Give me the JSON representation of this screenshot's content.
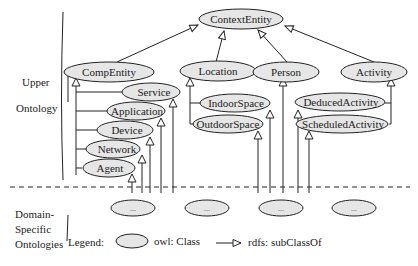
{
  "diagram": {
    "sections": {
      "upper": [
        "Upper",
        "Ontology"
      ],
      "domain": [
        "Domain-",
        "Specific",
        "Ontologies"
      ]
    },
    "nodes": {
      "context_entity": "ContextEntity",
      "comp_entity": "CompEntity",
      "location": "Location",
      "person": "Person",
      "activity": "Activity",
      "service": "Service",
      "application": "Application",
      "device": "Device",
      "network": "Network",
      "agent": "Agent",
      "indoor_space": "IndoorSpace",
      "outdoor_space": "OutdoorSpace",
      "deduced_activity": "DeducedActivity",
      "scheduled_activity": "ScheduledActivity"
    },
    "domain_nodes": [
      "...",
      "...",
      "...",
      "...",
      "..."
    ],
    "edges": [
      {
        "from": "CompEntity",
        "to": "ContextEntity"
      },
      {
        "from": "Location",
        "to": "ContextEntity"
      },
      {
        "from": "Person",
        "to": "ContextEntity"
      },
      {
        "from": "Activity",
        "to": "ContextEntity"
      },
      {
        "from": "Service",
        "to": "CompEntity"
      },
      {
        "from": "Application",
        "to": "CompEntity"
      },
      {
        "from": "Device",
        "to": "CompEntity"
      },
      {
        "from": "Network",
        "to": "CompEntity"
      },
      {
        "from": "Agent",
        "to": "CompEntity"
      },
      {
        "from": "IndoorSpace",
        "to": "Location"
      },
      {
        "from": "OutdoorSpace",
        "to": "Location"
      },
      {
        "from": "DeducedActivity",
        "to": "Activity"
      },
      {
        "from": "ScheduledActivity",
        "to": "Activity"
      }
    ],
    "legend": {
      "label": "Legend:",
      "class_label": "owl: Class",
      "subclass_label": "rdfs: subClassOf"
    }
  }
}
